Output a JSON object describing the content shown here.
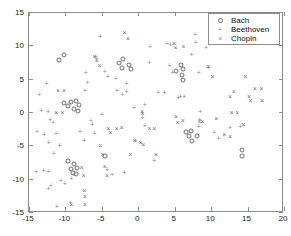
{
  "chart_data": {
    "type": "scatter",
    "title": "",
    "xlabel": "",
    "ylabel": "",
    "xlim": [
      -15,
      20
    ],
    "ylim": [
      -15,
      15
    ],
    "xticks": [
      -15,
      -10,
      -5,
      0,
      5,
      10,
      15,
      20
    ],
    "yticks": [
      -15,
      -10,
      -5,
      0,
      5,
      10,
      15
    ],
    "xticklabels": [
      "-15",
      "-10",
      "-5",
      "0",
      "5",
      "10",
      "15",
      "20"
    ],
    "yticklabels": [
      "-15",
      "-10",
      "-5",
      "0",
      "5",
      "10",
      "15"
    ],
    "grid": false,
    "legend_position": "upper right",
    "series": [
      {
        "name": "Bach",
        "marker": "circle",
        "color": "#6f6f6f",
        "points": [
          [
            -10.9,
            7.8
          ],
          [
            -10.2,
            8.5
          ],
          [
            -2.6,
            7.4
          ],
          [
            -2.1,
            8.0
          ],
          [
            -2.3,
            6.6
          ],
          [
            -1.3,
            7.1
          ],
          [
            -1.0,
            6.5
          ],
          [
            -10.2,
            1.3
          ],
          [
            -9.6,
            0.9
          ],
          [
            -9.2,
            1.5
          ],
          [
            -8.8,
            0.4
          ],
          [
            -8.6,
            1.6
          ],
          [
            -8.3,
            0.2
          ],
          [
            -8.1,
            1.1
          ],
          [
            5.2,
            6.1
          ],
          [
            5.8,
            7.1
          ],
          [
            6.2,
            6.5
          ],
          [
            6.0,
            5.6
          ],
          [
            6.1,
            4.8
          ],
          [
            6.6,
            -3.0
          ],
          [
            7.0,
            -3.6
          ],
          [
            7.3,
            -2.9
          ],
          [
            7.4,
            -4.3
          ],
          [
            8.0,
            -3.6
          ],
          [
            -9.7,
            -7.3
          ],
          [
            -9.2,
            -8.6
          ],
          [
            -8.8,
            -7.8
          ],
          [
            -9.0,
            -9.2
          ],
          [
            -8.4,
            -8.4
          ],
          [
            -8.6,
            -9.3
          ],
          [
            -4.6,
            -6.6
          ],
          [
            14.3,
            -5.7
          ],
          [
            14.2,
            -6.6
          ]
        ]
      },
      {
        "name": "Beethoven",
        "marker": "plus",
        "color": "#8a8a8a",
        "points": [
          [
            -13.6,
            2.5
          ],
          [
            -12.6,
            4.2
          ],
          [
            -13.3,
            0.1
          ],
          [
            -12.4,
            0.0
          ],
          [
            -12.1,
            -1.2
          ],
          [
            -11.7,
            -1.6
          ],
          [
            -13.9,
            -3.0
          ],
          [
            -12.9,
            -3.4
          ],
          [
            -12.3,
            -4.7
          ],
          [
            -11.6,
            -6.3
          ],
          [
            -12.0,
            -11.1
          ],
          [
            -12.3,
            -11.6
          ],
          [
            -14.0,
            -9.0
          ],
          [
            -13.0,
            -8.8
          ],
          [
            -12.3,
            -9.0
          ],
          [
            -11.3,
            -3.3
          ],
          [
            -10.8,
            -5.1
          ],
          [
            -10.6,
            -10.4
          ],
          [
            -10.1,
            -10.8
          ],
          [
            -9.3,
            -13.6
          ],
          [
            -9.2,
            -10.0
          ],
          [
            -8.0,
            -3.0
          ],
          [
            -7.4,
            -4.4
          ],
          [
            -7.2,
            5.9
          ],
          [
            -7.0,
            4.4
          ],
          [
            -7.3,
            3.1
          ],
          [
            -6.5,
            -1.4
          ],
          [
            -6.3,
            -2.0
          ],
          [
            -6.0,
            -3.3
          ],
          [
            -5.9,
            8.3
          ],
          [
            -5.7,
            8.0
          ],
          [
            -5.2,
            11.3
          ],
          [
            -5.0,
            -0.5
          ],
          [
            -4.6,
            6.0
          ],
          [
            -4.2,
            5.3
          ],
          [
            -4.3,
            -8.7
          ],
          [
            -3.6,
            -9.5
          ],
          [
            -3.1,
            4.9
          ],
          [
            -2.9,
            3.1
          ],
          [
            -2.2,
            2.5
          ],
          [
            -1.6,
            4.2
          ],
          [
            -1.6,
            3.0
          ],
          [
            -1.9,
            -9.1
          ],
          [
            -0.6,
            0.6
          ],
          [
            -0.4,
            -4.4
          ],
          [
            0.9,
            1.0
          ],
          [
            0.6,
            -0.9
          ],
          [
            0.9,
            -2.1
          ],
          [
            1.6,
            9.8
          ],
          [
            1.5,
            7.3
          ],
          [
            2.2,
            -7.4
          ],
          [
            2.7,
            2.9
          ],
          [
            3.6,
            2.9
          ],
          [
            3.9,
            10.2
          ],
          [
            4.4,
            10.0
          ],
          [
            4.7,
            5.8
          ],
          [
            4.3,
            6.9
          ],
          [
            5.5,
            2.1
          ],
          [
            5.8,
            2.2
          ],
          [
            6.3,
            2.3
          ],
          [
            7.8,
            11.6
          ],
          [
            7.9,
            10.4
          ],
          [
            7.3,
            8.6
          ],
          [
            8.3,
            5.8
          ],
          [
            8.5,
            0.0
          ],
          [
            8.4,
            -1.2
          ],
          [
            8.3,
            -2.3
          ],
          [
            9.3,
            9.6
          ],
          [
            9.6,
            6.6
          ],
          [
            10.4,
            -3.2
          ],
          [
            11.0,
            -4.0
          ],
          [
            12.6,
            -2.4
          ],
          [
            14.0,
            -2.2
          ],
          [
            -11.2,
            -14.2
          ]
        ]
      },
      {
        "name": "Chopin",
        "marker": "cross",
        "color": "#6f6f6f",
        "points": [
          [
            -11.0,
            3.1
          ],
          [
            -10.2,
            3.1
          ],
          [
            -11.3,
            -0.1
          ],
          [
            -10.4,
            -0.2
          ],
          [
            -9.2,
            -14.0
          ],
          [
            -7.8,
            -8.4
          ],
          [
            -7.5,
            -9.6
          ],
          [
            -7.4,
            -11.9
          ],
          [
            -7.3,
            -12.8
          ],
          [
            -7.3,
            -13.9
          ],
          [
            -6.0,
            8.2
          ],
          [
            -5.7,
            7.6
          ],
          [
            -5.3,
            6.9
          ],
          [
            -5.2,
            -5.1
          ],
          [
            -4.9,
            -6.5
          ],
          [
            -4.6,
            -8.3
          ],
          [
            -4.3,
            -9.6
          ],
          [
            -4.1,
            -2.6
          ],
          [
            -3.8,
            -3.2
          ],
          [
            -3.0,
            -2.6
          ],
          [
            -2.3,
            -2.4
          ],
          [
            -1.9,
            11.9
          ],
          [
            -1.4,
            10.9
          ],
          [
            -1.1,
            -6.5
          ],
          [
            -0.5,
            -4.4
          ],
          [
            0.3,
            -4.6
          ],
          [
            0.7,
            -5.0
          ],
          [
            0.5,
            0.0
          ],
          [
            0.6,
            -0.3
          ],
          [
            1.5,
            -2.6
          ],
          [
            2.2,
            -2.5
          ],
          [
            2.4,
            -6.4
          ],
          [
            4.9,
            10.2
          ],
          [
            5.1,
            9.6
          ],
          [
            5.2,
            -0.8
          ],
          [
            5.4,
            -1.6
          ],
          [
            6.1,
            -1.4
          ],
          [
            6.2,
            9.7
          ],
          [
            8.4,
            -1.5
          ],
          [
            8.8,
            -1.5
          ],
          [
            9.6,
            6.8
          ],
          [
            10.2,
            5.2
          ],
          [
            10.7,
            -1.1
          ],
          [
            11.8,
            -3.5
          ],
          [
            12.6,
            -3.7
          ],
          [
            12.6,
            2.3
          ],
          [
            13.1,
            3.0
          ],
          [
            12.8,
            -0.2
          ],
          [
            13.6,
            -0.2
          ],
          [
            14.7,
            5.3
          ],
          [
            15.2,
            2.3
          ],
          [
            15.4,
            1.6
          ],
          [
            16.0,
            3.5
          ],
          [
            16.9,
            3.4
          ],
          [
            17.0,
            1.6
          ],
          [
            14.4,
            -2.0
          ]
        ]
      }
    ]
  },
  "legend": {
    "entries": [
      {
        "label": "Bach",
        "symbol": "circle-marker-icon"
      },
      {
        "label": "Beethoven",
        "symbol": "plus-marker-icon"
      },
      {
        "label": "Chopin",
        "symbol": "cross-marker-icon"
      }
    ]
  }
}
